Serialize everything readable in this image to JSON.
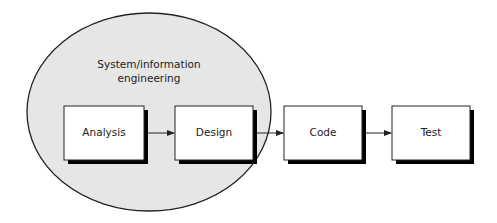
{
  "diagram": {
    "type": "process-flow",
    "colors": {
      "ellipse_fill": "#e6e6e6",
      "stroke": "#222222",
      "box_fill": "#ffffff",
      "shadow": "#000000"
    },
    "group": {
      "label_line1": "System/information",
      "label_line2": "engineering"
    },
    "nodes": [
      {
        "id": "analysis",
        "label": "Analysis"
      },
      {
        "id": "design",
        "label": "Design"
      },
      {
        "id": "code",
        "label": "Code"
      },
      {
        "id": "test",
        "label": "Test"
      }
    ],
    "edges": [
      {
        "from": "analysis",
        "to": "design"
      },
      {
        "from": "design",
        "to": "code"
      },
      {
        "from": "code",
        "to": "test"
      }
    ]
  }
}
